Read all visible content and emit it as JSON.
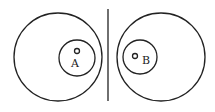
{
  "diagram": {
    "left": {
      "label": "A",
      "outer": {
        "cx": 58,
        "cy": 57,
        "r": 44
      },
      "inner": {
        "cx": 77,
        "cy": 58,
        "r": 18
      },
      "dot": {
        "cx": 77,
        "cy": 51,
        "r": 2.5
      },
      "label_pos": {
        "x": 75,
        "y": 67
      }
    },
    "divider": {
      "x": 108,
      "y1": 9,
      "y2": 101
    },
    "right": {
      "label": "B",
      "outer": {
        "cx": 161,
        "cy": 57,
        "r": 44
      },
      "inner": {
        "cx": 140,
        "cy": 57,
        "r": 17
      },
      "dot": {
        "cx": 135,
        "cy": 56,
        "r": 2.5
      },
      "label_pos": {
        "x": 146,
        "y": 64
      }
    },
    "stroke_color": "#222222"
  }
}
